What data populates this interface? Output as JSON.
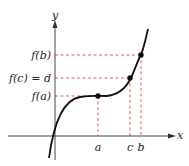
{
  "diagram": {
    "axes": {
      "x_label": "x",
      "y_label": "y"
    },
    "y_labels": {
      "fb": "f(b)",
      "fc": "f(c) = d",
      "fa": "f(a)"
    },
    "x_labels": {
      "a": "a",
      "c": "c",
      "b": "b"
    },
    "colors": {
      "curve": "#111111",
      "guide": "#e05050",
      "axis": "#333333"
    }
  }
}
